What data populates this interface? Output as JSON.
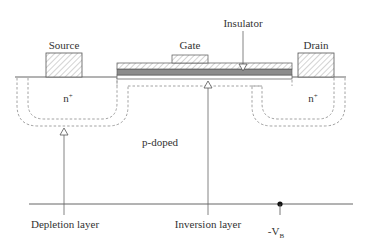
{
  "diagram": {
    "labels": {
      "source": "Source",
      "gate": "Gate",
      "drain": "Drain",
      "insulator": "Insulator",
      "source_doping": "n+",
      "drain_doping": "n+",
      "substrate": "p-doped",
      "depletion": "Depletion layer",
      "inversion": "Inversion layer",
      "bias_prefix": "-V",
      "bias_sub": "B"
    },
    "colors": {
      "line": "#555555",
      "hatch": "#9a9a9a",
      "oxide_dark": "#8c8c8c",
      "dashed": "#888888",
      "text": "#333333"
    }
  }
}
